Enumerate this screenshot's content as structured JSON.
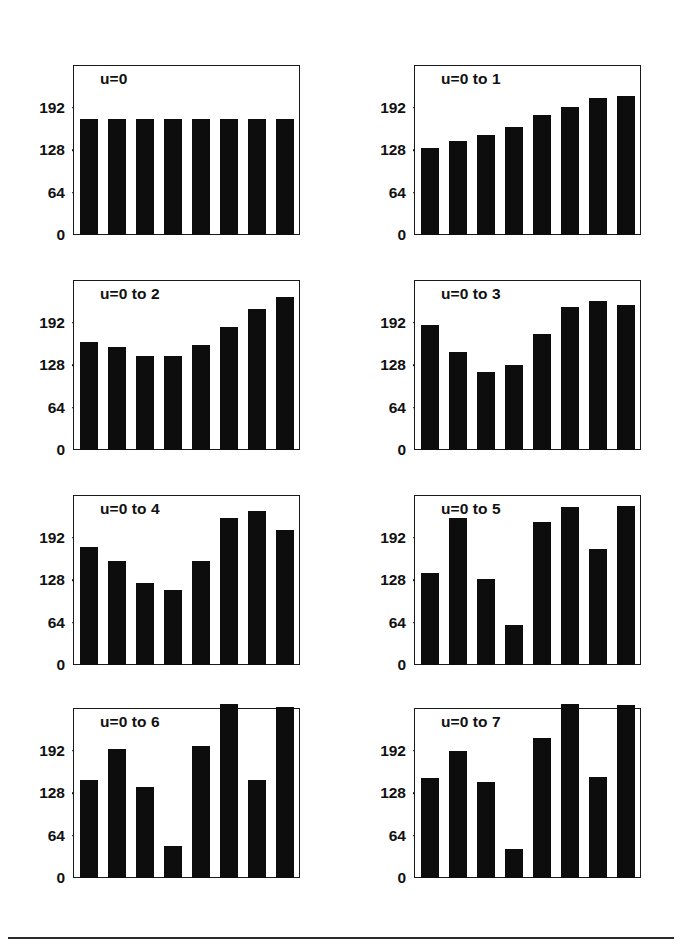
{
  "figure": {
    "panel_count": 8,
    "columns": 2,
    "rows": 4,
    "bar_color": "#0d0d0d",
    "axis_color": "#1a1a1a",
    "background": "#ffffff",
    "has_bottom_rule": true
  },
  "axis": {
    "ylim": [
      0,
      256
    ],
    "tick_values": [
      0,
      64,
      128,
      192
    ],
    "tick_labels": [
      "0",
      "64",
      "128",
      "192"
    ],
    "grid": false,
    "xlabel": "",
    "ylabel": "",
    "x_tick_labels": []
  },
  "chart_data": [
    {
      "type": "bar",
      "title": "u=0",
      "panel_index": 0,
      "xlabel": "",
      "ylabel": "",
      "ylim": [
        0,
        256
      ],
      "categories": [
        "1",
        "2",
        "3",
        "4",
        "5",
        "6",
        "7",
        "8"
      ],
      "values": [
        175,
        175,
        175,
        175,
        175,
        175,
        175,
        175
      ],
      "tick_values": [
        0,
        64,
        128,
        192
      ],
      "grid": false
    },
    {
      "type": "bar",
      "title": "u=0 to 1",
      "panel_index": 1,
      "xlabel": "",
      "ylabel": "",
      "ylim": [
        0,
        256
      ],
      "categories": [
        "1",
        "2",
        "3",
        "4",
        "5",
        "6",
        "7",
        "8"
      ],
      "values": [
        131,
        141,
        151,
        163,
        180,
        193,
        206,
        210
      ],
      "tick_values": [
        0,
        64,
        128,
        192
      ],
      "grid": false
    },
    {
      "type": "bar",
      "title": "u=0 to 2",
      "panel_index": 2,
      "xlabel": "",
      "ylabel": "",
      "ylim": [
        0,
        256
      ],
      "categories": [
        "1",
        "2",
        "3",
        "4",
        "5",
        "6",
        "7",
        "8"
      ],
      "values": [
        162,
        155,
        141,
        141,
        158,
        185,
        212,
        230
      ],
      "tick_values": [
        0,
        64,
        128,
        192
      ],
      "grid": false
    },
    {
      "type": "bar",
      "title": "u=0 to 3",
      "panel_index": 3,
      "xlabel": "",
      "ylabel": "",
      "ylim": [
        0,
        256
      ],
      "categories": [
        "1",
        "2",
        "3",
        "4",
        "5",
        "6",
        "7",
        "8"
      ],
      "values": [
        189,
        148,
        118,
        128,
        175,
        216,
        224,
        218
      ],
      "tick_values": [
        0,
        64,
        128,
        192
      ],
      "grid": false
    },
    {
      "type": "bar",
      "title": "u=0 to 4",
      "panel_index": 4,
      "xlabel": "",
      "ylabel": "",
      "ylim": [
        0,
        256
      ],
      "categories": [
        "1",
        "2",
        "3",
        "4",
        "5",
        "6",
        "7",
        "8"
      ],
      "values": [
        178,
        157,
        124,
        113,
        157,
        222,
        232,
        203
      ],
      "tick_values": [
        0,
        64,
        128,
        192
      ],
      "grid": false
    },
    {
      "type": "bar",
      "title": "u=0 to 5",
      "panel_index": 5,
      "xlabel": "",
      "ylabel": "",
      "ylim": [
        0,
        256
      ],
      "categories": [
        "1",
        "2",
        "3",
        "4",
        "5",
        "6",
        "7",
        "8"
      ],
      "values": [
        138,
        222,
        129,
        60,
        215,
        238,
        174,
        240
      ],
      "tick_values": [
        0,
        64,
        128,
        192
      ],
      "grid": false
    },
    {
      "type": "bar",
      "title": "u=0 to 6",
      "panel_index": 6,
      "xlabel": "",
      "ylabel": "",
      "ylim": [
        0,
        256
      ],
      "categories": [
        "1",
        "2",
        "3",
        "4",
        "5",
        "6",
        "7",
        "8"
      ],
      "values": [
        148,
        194,
        137,
        48,
        199,
        262,
        148,
        258
      ],
      "tick_values": [
        0,
        64,
        128,
        192
      ],
      "grid": false
    },
    {
      "type": "bar",
      "title": "u=0 to 7",
      "panel_index": 7,
      "xlabel": "",
      "ylabel": "",
      "ylim": [
        0,
        256
      ],
      "categories": [
        "1",
        "2",
        "3",
        "4",
        "5",
        "6",
        "7",
        "8"
      ],
      "values": [
        150,
        192,
        144,
        44,
        211,
        262,
        152,
        260
      ],
      "tick_values": [
        0,
        64,
        128,
        192
      ],
      "grid": false
    }
  ]
}
